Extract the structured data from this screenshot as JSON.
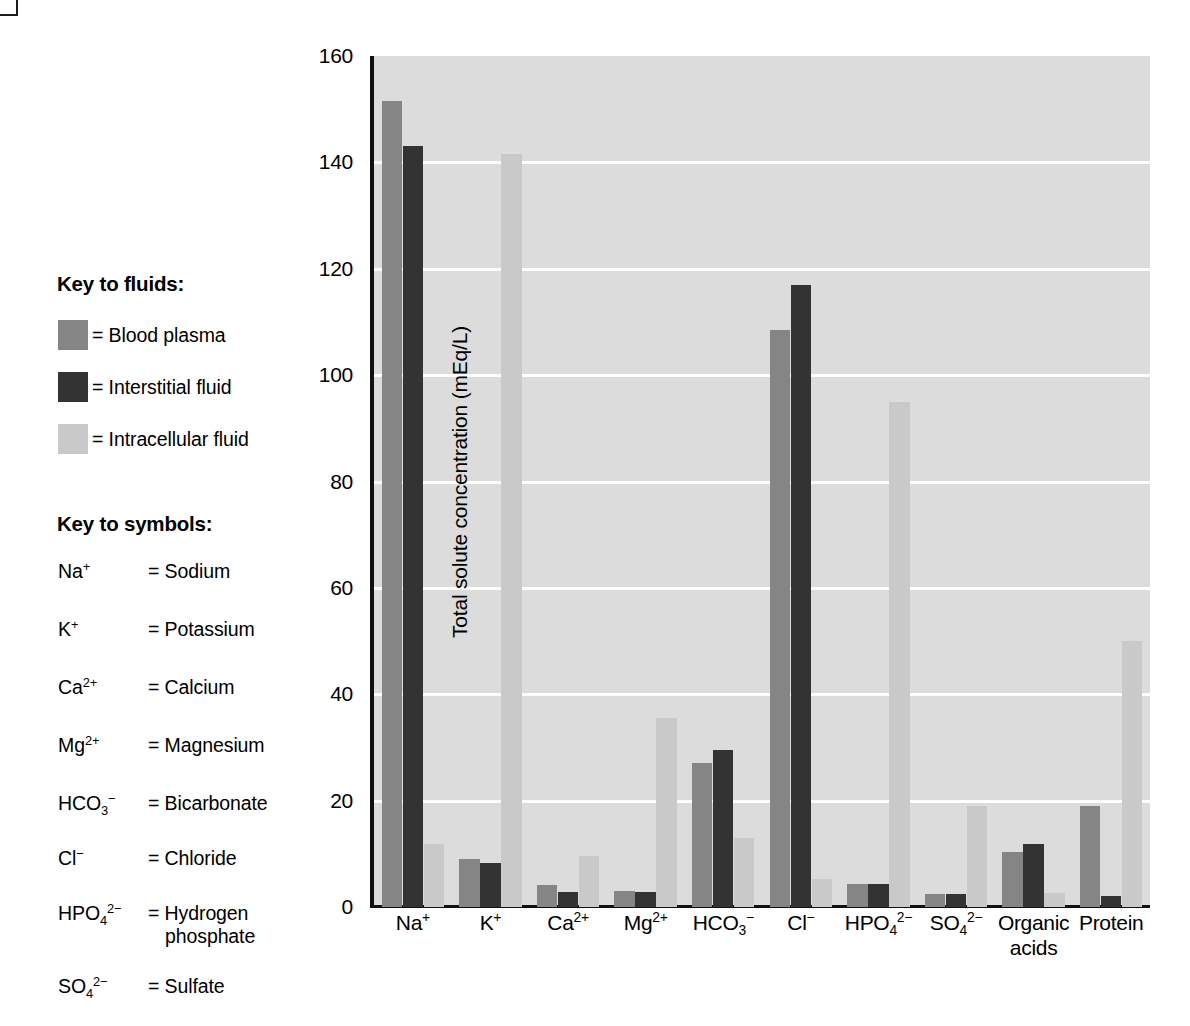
{
  "figure": {
    "y_axis_title": "Total solute concentration (mEq/L)"
  },
  "key_to_fluids": {
    "title": "Key to fluids:",
    "items": [
      {
        "label": "= Blood plasma",
        "color": "#858585",
        "series": "Blood plasma"
      },
      {
        "label": "= Interstitial fluid",
        "color": "#333333",
        "series": "Interstitial fluid"
      },
      {
        "label": "= Intracellular fluid",
        "color": "#c9c9c9",
        "series": "Intracellular fluid"
      }
    ]
  },
  "key_to_symbols": {
    "title": "Key to symbols:",
    "items": [
      {
        "formula_html": "Na<sup class=\"chg\">+</sup>",
        "definition": "= Sodium"
      },
      {
        "formula_html": "K<sup class=\"chg\">+</sup>",
        "definition": "= Potassium"
      },
      {
        "formula_html": "Ca<sup class=\"chg\">2+</sup>",
        "definition": "= Calcium"
      },
      {
        "formula_html": "Mg<sup class=\"chg\">2+</sup>",
        "definition": "= Magnesium"
      },
      {
        "formula_html": "HCO<sub class=\"sb\">3</sub><sup class=\"chg\">−</sup>",
        "definition": "= Bicarbonate"
      },
      {
        "formula_html": "Cl<sup class=\"chg\">−</sup>",
        "definition": "= Chloride"
      },
      {
        "formula_html": "HPO<sub class=\"sb\">4</sub><sup class=\"chg\">2−</sup>",
        "definition": "= Hydrogen",
        "definition_cont": "phosphate"
      },
      {
        "formula_html": "SO<sub class=\"sb\">4</sub><sup class=\"chg\">2−</sup>",
        "definition": "= Sulfate"
      }
    ]
  },
  "chart_data": {
    "type": "bar",
    "title": "",
    "xlabel": "",
    "ylabel": "Total solute concentration (mEq/L)",
    "ylim": [
      0,
      160
    ],
    "yticks": [
      0,
      20,
      40,
      60,
      80,
      100,
      120,
      140,
      160
    ],
    "ytick_labels": [
      "0",
      "20",
      "40",
      "60",
      "80",
      "100",
      "120",
      "140",
      "160"
    ],
    "grid": "horizontal",
    "legend_position": "outside-left",
    "categories": [
      "Na+",
      "K+",
      "Ca2+",
      "Mg2+",
      "HCO3-",
      "Cl-",
      "HPO4 2-",
      "SO4 2-",
      "Organic acids",
      "Protein"
    ],
    "category_labels_html": [
      "Na<sup class=\"chg\">+</sup>",
      "K<sup class=\"chg\">+</sup>",
      "Ca<sup class=\"chg\">2+</sup>",
      "Mg<sup class=\"chg\">2+</sup>",
      "HCO<sub class=\"sb\">3</sub><sup class=\"chg\">−</sup>",
      "Cl<sup class=\"chg\">−</sup>",
      "HPO<sub class=\"sb\">4</sub><sup class=\"chg\">2−</sup>",
      "SO<sub class=\"sb\">4</sub><sup class=\"chg\">2−</sup>",
      "Organic<br>acids",
      "Protein"
    ],
    "series": [
      {
        "name": "Blood plasma",
        "color": "#858585",
        "values": [
          151.5,
          0,
          4.2,
          3.0,
          27.0,
          108.5,
          4.3,
          2.5,
          10.3,
          19.0
        ]
      },
      {
        "name": "Interstitial fluid",
        "color": "#333333",
        "values": [
          143.0,
          8.3,
          2.9,
          2.8,
          29.5,
          117.0,
          4.3,
          2.5,
          11.8,
          2.0
        ]
      },
      {
        "name": "Intracellular fluid",
        "color": "#c9c9c9",
        "values": [
          11.8,
          141.5,
          9.5,
          35.5,
          13.0,
          5.3,
          95.0,
          19.0,
          2.6,
          50.0
        ]
      }
    ],
    "series_note_k_plasma": 9.0
  }
}
